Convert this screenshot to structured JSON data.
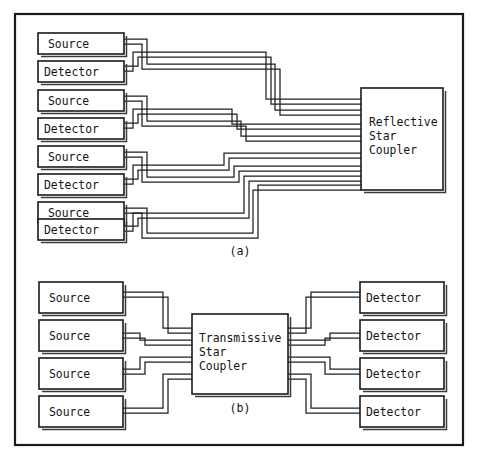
{
  "figure": {
    "kind": "block-diagram",
    "background_color": "#ffffff",
    "line_color": "#1f1f1f",
    "frame": {
      "x": 14,
      "y": 13,
      "width": 450,
      "height": 433
    },
    "panels": [
      {
        "id": "panel-a",
        "caption": "(a)",
        "caption_x": 240,
        "caption_y": 255,
        "coupler": {
          "label_lines": [
            "Reflective",
            "Star",
            "Coupler"
          ],
          "x": 361,
          "y": 88,
          "width": 82,
          "height": 102
        },
        "nodes": [
          {
            "label": "Source",
            "x": 38,
            "y": 33,
            "width": 86,
            "height": 21
          },
          {
            "label": "Detector",
            "x": 38,
            "y": 61,
            "width": 86,
            "height": 21
          },
          {
            "label": "Source",
            "x": 38,
            "y": 90,
            "width": 86,
            "height": 21
          },
          {
            "label": "Detector",
            "x": 38,
            "y": 118,
            "width": 86,
            "height": 21
          },
          {
            "label": "Source",
            "x": 38,
            "y": 146,
            "width": 86,
            "height": 21
          },
          {
            "label": "Detector",
            "x": 38,
            "y": 174,
            "width": 86,
            "height": 21
          },
          {
            "label": "Source",
            "x": 38,
            "y": 202,
            "width": 86,
            "height": 21
          },
          {
            "label": "Detector",
            "x": 38,
            "y": 220,
            "width": 86,
            "height": 21
          }
        ]
      },
      {
        "id": "panel-b",
        "caption": "(b)",
        "caption_x": 240,
        "caption_y": 410,
        "coupler": {
          "label_lines": [
            "Transmissive",
            "Star",
            "Coupler"
          ],
          "x": 192,
          "y": 314,
          "width": 96,
          "height": 80
        },
        "source_nodes": [
          {
            "label": "Source",
            "x": 39,
            "y": 282,
            "width": 84,
            "height": 31
          },
          {
            "label": "Source",
            "x": 39,
            "y": 320,
            "width": 84,
            "height": 31
          },
          {
            "label": "Source",
            "x": 39,
            "y": 358,
            "width": 84,
            "height": 31
          },
          {
            "label": "Source",
            "x": 39,
            "y": 396,
            "width": 84,
            "height": 31
          }
        ],
        "detector_nodes": [
          {
            "label": "Detector",
            "x": 360,
            "y": 282,
            "width": 84,
            "height": 31
          },
          {
            "label": "Detector",
            "x": 360,
            "y": 320,
            "width": 84,
            "height": 31
          },
          {
            "label": "Detector",
            "x": 360,
            "y": 358,
            "width": 84,
            "height": 31
          },
          {
            "label": "Detector",
            "x": 360,
            "y": 396,
            "width": 84,
            "height": 31
          }
        ]
      }
    ]
  },
  "labels": {
    "source": "Source",
    "detector": "Detector",
    "reflective_line1": "Reflective",
    "reflective_line2": "Star",
    "reflective_line3": "Coupler",
    "transmissive_line1": "Transmissive",
    "transmissive_line2": "Star",
    "transmissive_line3": "Coupler",
    "caption_a": "(a)",
    "caption_b": "(b)"
  }
}
